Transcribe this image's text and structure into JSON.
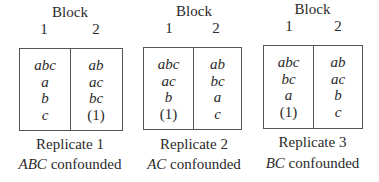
{
  "block_heading": "Block",
  "block_numbers": [
    "1",
    "2"
  ],
  "replicates": [
    {
      "label": "Replicate 1",
      "confounded_effect": "ABC",
      "confounded_suffix": " confounded",
      "block1": [
        "abc",
        "a",
        "b",
        "c"
      ],
      "block2": [
        "ab",
        "ac",
        "bc",
        "(1)"
      ]
    },
    {
      "label": "Replicate 2",
      "confounded_effect": "AC",
      "confounded_suffix": " confounded",
      "block1": [
        "abc",
        "ac",
        "b",
        "(1)"
      ],
      "block2": [
        "ab",
        "bc",
        "a",
        "c"
      ]
    },
    {
      "label": "Replicate 3",
      "confounded_effect": "BC",
      "confounded_suffix": " confounded",
      "block1": [
        "abc",
        "bc",
        "a",
        "(1)"
      ],
      "block2": [
        "ab",
        "ac",
        "b",
        "c"
      ]
    }
  ]
}
